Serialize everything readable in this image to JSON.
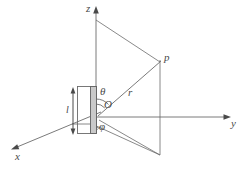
{
  "figure": {
    "background_color": "#ffffff",
    "line_color": "#6b6b6b",
    "plate_fill_color": "#c9c9c9",
    "labels": {
      "z_axis": "z",
      "y_axis": "y",
      "x_axis": "x",
      "point_p": "p",
      "radius": "r",
      "theta": "θ",
      "origin": "O",
      "phi": "φ",
      "length": "l"
    }
  }
}
